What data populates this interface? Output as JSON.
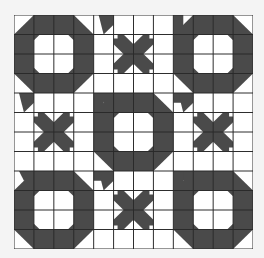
{
  "image": {
    "description": "Quilt block pattern: 3x3 arrangement of 4x4-cell blocks; corner and center blocks are octagon rings, edge blocks are small X motifs",
    "grid": {
      "cols": 12,
      "rows": 12,
      "cell_px": 19.9
    },
    "colors": {
      "dark": "#4a4a4a",
      "light": "#ffffff",
      "line": "#2a2a2a",
      "background": "#f4f4f4"
    },
    "blocks": [
      [
        "ring",
        "x",
        "ring"
      ],
      [
        "x",
        "ring",
        "x"
      ],
      [
        "ring",
        "x",
        "ring"
      ]
    ]
  }
}
